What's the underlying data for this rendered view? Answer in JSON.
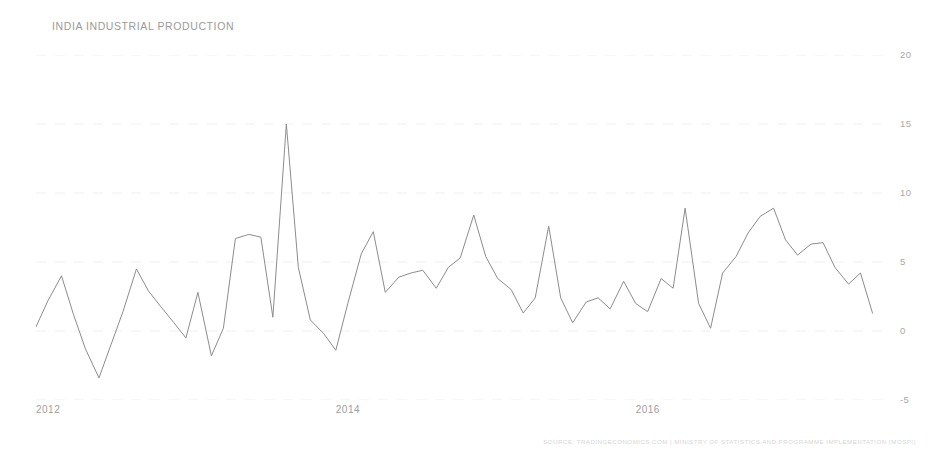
{
  "chart_data": {
    "type": "line",
    "title": "INDIA INDUSTRIAL PRODUCTION",
    "xlabel": "",
    "ylabel": "",
    "ylim": [
      -5,
      20
    ],
    "xlim": [
      2012.0,
      2017.67
    ],
    "grid": true,
    "legend": "none",
    "y_ticks": [
      20,
      15,
      10,
      5,
      0,
      -5
    ],
    "y_tick_labels": [
      "20",
      "15",
      "10",
      "5",
      "0",
      "-5"
    ],
    "x_ticks": [
      2012,
      2014,
      2016
    ],
    "x_tick_labels": [
      "2012",
      "2014",
      "2016"
    ],
    "series_name": "Industrial Production YoY (%)",
    "line_color": "#8c8c8c",
    "x": [
      2012.0,
      2012.08,
      2012.17,
      2012.25,
      2012.33,
      2012.42,
      2012.5,
      2012.58,
      2012.67,
      2012.75,
      2012.83,
      2012.92,
      2013.0,
      2013.08,
      2013.17,
      2013.25,
      2013.33,
      2013.42,
      2013.5,
      2013.58,
      2013.67,
      2013.75,
      2013.83,
      2013.92,
      2014.0,
      2014.08,
      2014.17,
      2014.25,
      2014.33,
      2014.42,
      2014.5,
      2014.58,
      2014.67,
      2014.75,
      2014.83,
      2014.92,
      2015.0,
      2015.08,
      2015.17,
      2015.25,
      2015.33,
      2015.42,
      2015.5,
      2015.58,
      2015.67,
      2015.75,
      2015.83,
      2015.92,
      2016.0,
      2016.08,
      2016.17,
      2016.25,
      2016.33,
      2016.42,
      2016.5,
      2016.58,
      2016.67,
      2016.75,
      2016.83,
      2016.92,
      2017.0,
      2017.08,
      2017.17,
      2017.25,
      2017.33,
      2017.42,
      2017.5,
      2017.58
    ],
    "values": [
      0.3,
      2.2,
      4.0,
      1.2,
      -1.3,
      -3.4,
      -1.0,
      1.4,
      4.5,
      2.9,
      1.8,
      0.6,
      -0.5,
      2.8,
      -1.8,
      0.2,
      6.7,
      7.0,
      6.8,
      1.0,
      15.0,
      4.6,
      0.8,
      -0.2,
      -1.4,
      2.0,
      5.6,
      7.2,
      2.8,
      3.9,
      4.2,
      4.4,
      3.1,
      4.6,
      5.3,
      8.4,
      5.4,
      3.8,
      3.0,
      1.3,
      2.4,
      7.6,
      2.4,
      0.6,
      2.1,
      2.4,
      1.6,
      3.6,
      2.0,
      1.4,
      3.8,
      3.1,
      8.9,
      2.0,
      0.2,
      4.2,
      5.4,
      7.1,
      8.3,
      8.9,
      6.6,
      5.5,
      6.3,
      6.4,
      4.6,
      3.4,
      4.2,
      1.3
    ],
    "annotations": [],
    "source": "SOURCE: TRADINGECONOMICS.COM | MINISTRY OF STATISTICS AND PROGRAMME IMPLEMENTATION (MOSPI)"
  },
  "footer": {
    "source_text": "SOURCE: TRADINGECONOMICS.COM | MINISTRY OF STATISTICS AND PROGRAMME IMPLEMENTATION (MOSPI)"
  }
}
